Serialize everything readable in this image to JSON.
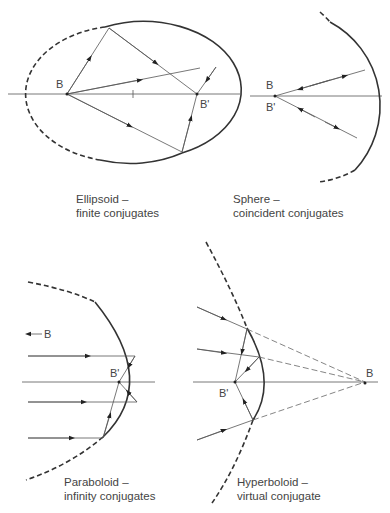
{
  "panels": [
    {
      "id": "ellipsoid",
      "title": "Ellipsoid –",
      "subtitle": "finite conjugates",
      "point_labels": [
        "B",
        "B'"
      ]
    },
    {
      "id": "sphere",
      "title": "Sphere –",
      "subtitle": "coincident conjugates",
      "point_labels": [
        "B",
        "B'"
      ]
    },
    {
      "id": "paraboloid",
      "title": "Paraboloid –",
      "subtitle": "infinity conjugates",
      "point_labels": [
        "B",
        "B'"
      ]
    },
    {
      "id": "hyperboloid",
      "title": "Hyperboloid –",
      "subtitle": "virtual conjugate",
      "point_labels": [
        "B",
        "B'"
      ]
    }
  ],
  "footer_caption": "(cropped figure caption)"
}
